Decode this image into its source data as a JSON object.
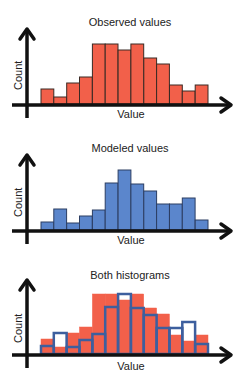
{
  "colors": {
    "observed_fill": "#F2604A",
    "bar_stroke": "#3a2a24",
    "modeled_fill": "#5B86CC",
    "modeled_stroke": "#2c3e63",
    "overlay_stroke": "#3D5F9E",
    "axis": "#111111"
  },
  "chart_data": [
    {
      "type": "bar",
      "title": "Observed values",
      "xlabel": "Value",
      "ylabel": "Count",
      "categories": [
        "1",
        "2",
        "3",
        "4",
        "5",
        "6",
        "7",
        "8",
        "9",
        "10",
        "11",
        "12",
        "13"
      ],
      "values": [
        15,
        7,
        21,
        27,
        60,
        60,
        54,
        60,
        46,
        40,
        19,
        13,
        19
      ],
      "ylim": [
        0,
        70
      ],
      "grid": false
    },
    {
      "type": "bar",
      "title": "Modeled values",
      "xlabel": "Value",
      "ylabel": "Count",
      "categories": [
        "1",
        "2",
        "3",
        "4",
        "5",
        "6",
        "7",
        "8",
        "9",
        "10",
        "11",
        "12",
        "13"
      ],
      "values": [
        8,
        21,
        7,
        14,
        20,
        47,
        60,
        46,
        39,
        26,
        26,
        32,
        10
      ],
      "ylim": [
        0,
        70
      ],
      "grid": false
    },
    {
      "type": "bar",
      "title": "Both histograms",
      "xlabel": "Value",
      "ylabel": "Count",
      "categories": [
        "1",
        "2",
        "3",
        "4",
        "5",
        "6",
        "7",
        "8",
        "9",
        "10",
        "11",
        "12",
        "13"
      ],
      "series": [
        {
          "name": "Observed",
          "style": "filled",
          "values": [
            15,
            7,
            21,
            27,
            60,
            60,
            54,
            60,
            46,
            40,
            19,
            13,
            19
          ]
        },
        {
          "name": "Modeled",
          "style": "outline",
          "values": [
            8,
            21,
            7,
            14,
            20,
            47,
            60,
            46,
            39,
            26,
            26,
            32,
            10
          ]
        }
      ],
      "ylim": [
        0,
        70
      ],
      "grid": false
    }
  ],
  "panels": [
    {
      "title": "Observed values",
      "xlabel": "Value",
      "ylabel": "Count"
    },
    {
      "title": "Modeled values",
      "xlabel": "Value",
      "ylabel": "Count"
    },
    {
      "title": "Both histograms",
      "xlabel": "Value",
      "ylabel": "Count"
    }
  ]
}
